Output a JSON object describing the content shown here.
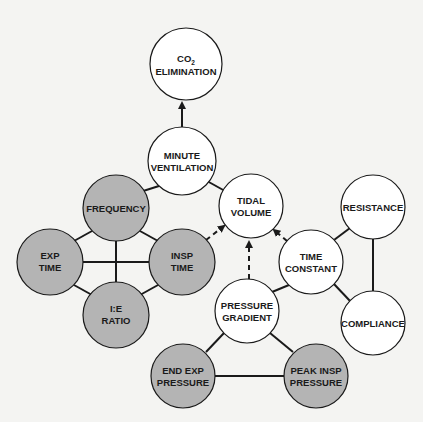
{
  "diagram": {
    "colors": {
      "background": "#f4f4f2",
      "node_white": "#ffffff",
      "node_grey": "#b4b4b4",
      "stroke": "#1a1a1a"
    },
    "nodes": {
      "co2": {
        "line1": "CO",
        "sub": "2",
        "line2": "ELIMINATION"
      },
      "mv": {
        "line1": "MINUTE",
        "line2": "VENTILATION"
      },
      "freq": {
        "line1": "FREQUENCY"
      },
      "tv": {
        "line1": "TIDAL",
        "line2": "VOLUME"
      },
      "resistance": {
        "line1": "RESISTANCE"
      },
      "exp_time": {
        "line1": "EXP",
        "line2": "TIME"
      },
      "insp_time": {
        "line1": "INSP",
        "line2": "TIME"
      },
      "time_constant": {
        "line1": "TIME",
        "line2": "CONSTANT"
      },
      "ie_ratio": {
        "line1": "I:E",
        "line2": "RATIO"
      },
      "pressure_gradient": {
        "line1": "PRESSURE",
        "line2": "GRADIENT"
      },
      "compliance": {
        "line1": "COMPLIANCE"
      },
      "end_exp": {
        "line1": "END EXP",
        "line2": "PRESSURE"
      },
      "peak_insp": {
        "line1": "PEAK INSP",
        "line2": "PRESSURE"
      }
    },
    "edges": [
      {
        "from": "MINUTE VENTILATION",
        "to": "CO2 ELIMINATION",
        "type": "arrow"
      },
      {
        "from": "MINUTE VENTILATION",
        "to": "FREQUENCY",
        "type": "line"
      },
      {
        "from": "MINUTE VENTILATION",
        "to": "TIDAL VOLUME",
        "type": "line"
      },
      {
        "from": "FREQUENCY",
        "to": "EXP TIME",
        "type": "line"
      },
      {
        "from": "FREQUENCY",
        "to": "INSP TIME",
        "type": "line"
      },
      {
        "from": "FREQUENCY",
        "to": "I:E RATIO",
        "type": "line"
      },
      {
        "from": "EXP TIME",
        "to": "INSP TIME",
        "type": "line"
      },
      {
        "from": "EXP TIME",
        "to": "I:E RATIO",
        "type": "line"
      },
      {
        "from": "INSP TIME",
        "to": "I:E RATIO",
        "type": "line"
      },
      {
        "from": "INSP TIME",
        "to": "TIDAL VOLUME",
        "type": "dashed-arrow"
      },
      {
        "from": "PRESSURE GRADIENT",
        "to": "TIDAL VOLUME",
        "type": "dashed-arrow"
      },
      {
        "from": "TIME CONSTANT",
        "to": "TIDAL VOLUME",
        "type": "dashed-arrow"
      },
      {
        "from": "TIME CONSTANT",
        "to": "RESISTANCE",
        "type": "line"
      },
      {
        "from": "TIME CONSTANT",
        "to": "COMPLIANCE",
        "type": "line"
      },
      {
        "from": "TIME CONSTANT",
        "to": "PRESSURE GRADIENT",
        "type": "line"
      },
      {
        "from": "RESISTANCE",
        "to": "COMPLIANCE",
        "type": "line"
      },
      {
        "from": "PRESSURE GRADIENT",
        "to": "END EXP PRESSURE",
        "type": "line"
      },
      {
        "from": "PRESSURE GRADIENT",
        "to": "PEAK INSP PRESSURE",
        "type": "line"
      },
      {
        "from": "END EXP PRESSURE",
        "to": "PEAK INSP PRESSURE",
        "type": "line"
      }
    ]
  }
}
